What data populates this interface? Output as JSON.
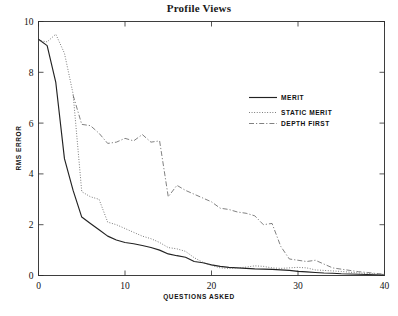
{
  "chart_data": {
    "type": "line",
    "title": "Profile Views",
    "xlabel": "QUESTIONS ASKED",
    "ylabel": "RMS ERROR",
    "xlim": [
      0,
      40
    ],
    "ylim": [
      0,
      10
    ],
    "xticks": [
      0,
      10,
      20,
      30,
      40
    ],
    "yticks": [
      0,
      2,
      4,
      6,
      8,
      10
    ],
    "xtick_labels": [
      "0",
      "10",
      "20",
      "30",
      "40"
    ],
    "ytick_labels": [
      "0",
      "2",
      "4",
      "6",
      "8",
      "10"
    ],
    "grid": false,
    "legend_position": "upper-right-inside",
    "series": [
      {
        "name": "MERIT",
        "style": "solid",
        "color": "#222222",
        "x": [
          0,
          1,
          2,
          3,
          4,
          5,
          6,
          7,
          8,
          9,
          10,
          11,
          12,
          13,
          14,
          15,
          16,
          17,
          18,
          19,
          20,
          21,
          22,
          23,
          24,
          25,
          26,
          27,
          28,
          29,
          30,
          31,
          32,
          33,
          34,
          35,
          36,
          37,
          38,
          39,
          40
        ],
        "y": [
          9.3,
          9.05,
          7.6,
          4.6,
          3.35,
          2.3,
          2.05,
          1.8,
          1.55,
          1.4,
          1.3,
          1.25,
          1.18,
          1.1,
          1.0,
          0.85,
          0.78,
          0.72,
          0.55,
          0.5,
          0.42,
          0.36,
          0.32,
          0.3,
          0.28,
          0.26,
          0.25,
          0.24,
          0.22,
          0.2,
          0.16,
          0.14,
          0.12,
          0.1,
          0.09,
          0.07,
          0.06,
          0.05,
          0.04,
          0.03,
          0.02
        ]
      },
      {
        "name": "STATIC MERIT",
        "style": "dotted",
        "color": "#555555",
        "x": [
          0,
          1,
          2,
          3,
          4,
          5,
          6,
          7,
          8,
          9,
          10,
          11,
          12,
          13,
          14,
          15,
          16,
          17,
          18,
          19,
          20,
          21,
          22,
          23,
          24,
          25,
          26,
          27,
          28,
          29,
          30,
          31,
          32,
          33,
          34,
          35,
          36,
          37,
          38,
          39,
          40
        ],
        "y": [
          9.25,
          9.2,
          9.5,
          8.75,
          7.15,
          3.3,
          3.1,
          3.0,
          2.1,
          2.0,
          1.85,
          1.7,
          1.55,
          1.45,
          1.3,
          1.1,
          1.05,
          0.95,
          0.7,
          0.52,
          0.4,
          0.3,
          0.28,
          0.3,
          0.33,
          0.38,
          0.36,
          0.3,
          0.28,
          0.3,
          0.32,
          0.3,
          0.22,
          0.2,
          0.18,
          0.16,
          0.13,
          0.1,
          0.08,
          0.06,
          0.04
        ]
      },
      {
        "name": "DEPTH FIRST",
        "style": "dashdot",
        "color": "#6a6a6a",
        "x": [
          4,
          5,
          6,
          7,
          8,
          9,
          10,
          11,
          12,
          13,
          14,
          15,
          16,
          17,
          18,
          19,
          20,
          21,
          22,
          23,
          24,
          25,
          26,
          27,
          28,
          29,
          30,
          31,
          32,
          33,
          34,
          35,
          36,
          37,
          38,
          39,
          40
        ],
        "y": [
          7.1,
          5.95,
          5.9,
          5.6,
          5.2,
          5.25,
          5.4,
          5.3,
          5.55,
          5.25,
          5.3,
          3.1,
          3.55,
          3.35,
          3.2,
          3.05,
          2.9,
          2.65,
          2.6,
          2.5,
          2.45,
          2.35,
          2.0,
          2.05,
          1.15,
          0.65,
          0.6,
          0.55,
          0.6,
          0.45,
          0.3,
          0.25,
          0.2,
          0.15,
          0.12,
          0.08,
          0.05
        ]
      }
    ]
  },
  "legend": {
    "items": [
      {
        "label": "MERIT",
        "style": "solid"
      },
      {
        "label": "STATIC MERIT",
        "style": "dotted"
      },
      {
        "label": "DEPTH FIRST",
        "style": "dashdot"
      }
    ]
  }
}
